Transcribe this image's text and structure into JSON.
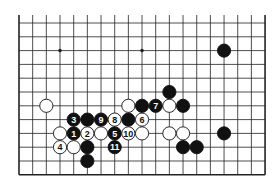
{
  "diagram": {
    "type": "go-board-fragment",
    "columns": 19,
    "rows": 12,
    "open_edge": "top",
    "colors": {
      "line": "#222222",
      "black": "#111111",
      "white": "#ffffff",
      "background": "#ffffff"
    },
    "star_points": [
      {
        "c": 3,
        "r": 2
      },
      {
        "c": 9,
        "r": 2
      }
    ],
    "stones": [
      {
        "c": 15,
        "r": 2,
        "color": "black",
        "label": ""
      },
      {
        "c": 11,
        "r": 5,
        "color": "black",
        "label": ""
      },
      {
        "c": 2,
        "r": 6,
        "color": "white",
        "label": ""
      },
      {
        "c": 8,
        "r": 6,
        "color": "white",
        "label": ""
      },
      {
        "c": 9,
        "r": 6,
        "color": "black",
        "label": ""
      },
      {
        "c": 10,
        "r": 6,
        "color": "black",
        "label": "7"
      },
      {
        "c": 11,
        "r": 6,
        "color": "white",
        "label": ""
      },
      {
        "c": 12,
        "r": 6,
        "color": "black",
        "label": ""
      },
      {
        "c": 4,
        "r": 7,
        "color": "black",
        "label": "3"
      },
      {
        "c": 5,
        "r": 7,
        "color": "black",
        "label": ""
      },
      {
        "c": 6,
        "r": 7,
        "color": "black",
        "label": "9"
      },
      {
        "c": 7,
        "r": 7,
        "color": "white",
        "label": "8"
      },
      {
        "c": 8,
        "r": 7,
        "color": "black",
        "label": ""
      },
      {
        "c": 9,
        "r": 7,
        "color": "white",
        "label": "6"
      },
      {
        "c": 3,
        "r": 8,
        "color": "white",
        "label": ""
      },
      {
        "c": 4,
        "r": 8,
        "color": "black",
        "label": "1"
      },
      {
        "c": 5,
        "r": 8,
        "color": "white",
        "label": "2"
      },
      {
        "c": 6,
        "r": 8,
        "color": "white",
        "label": ""
      },
      {
        "c": 7,
        "r": 8,
        "color": "black",
        "label": "5"
      },
      {
        "c": 8,
        "r": 8,
        "color": "white",
        "label": "10"
      },
      {
        "c": 9,
        "r": 8,
        "color": "white",
        "label": ""
      },
      {
        "c": 11,
        "r": 8,
        "color": "white",
        "label": ""
      },
      {
        "c": 12,
        "r": 8,
        "color": "white",
        "label": ""
      },
      {
        "c": 15,
        "r": 8,
        "color": "black",
        "label": ""
      },
      {
        "c": 3,
        "r": 9,
        "color": "white",
        "label": "4"
      },
      {
        "c": 4,
        "r": 9,
        "color": "white",
        "label": ""
      },
      {
        "c": 5,
        "r": 9,
        "color": "black",
        "label": ""
      },
      {
        "c": 7,
        "r": 9,
        "color": "black",
        "label": "11"
      },
      {
        "c": 12,
        "r": 9,
        "color": "black",
        "label": ""
      },
      {
        "c": 13,
        "r": 9,
        "color": "black",
        "label": ""
      },
      {
        "c": 5,
        "r": 10,
        "color": "black",
        "label": ""
      }
    ]
  }
}
